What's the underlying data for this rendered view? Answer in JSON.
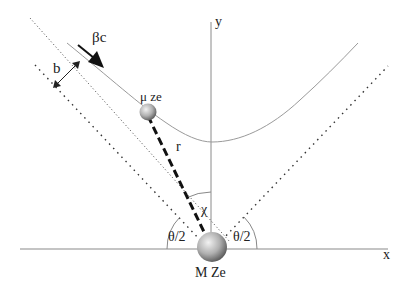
{
  "diagram": {
    "labels": {
      "velocity": "βc",
      "impact_parameter": "b",
      "projectile": "μ ze",
      "distance": "r",
      "angle_chi": "χ",
      "half_angle_left": "θ/2",
      "half_angle_right": "θ/2",
      "target": "M Ze",
      "x_axis": "x",
      "y_axis": "y"
    },
    "colors": {
      "line": "#222222",
      "curve": "#9a9a9a",
      "axis": "#8a8a8a",
      "sphere_light": "#e8e8e8",
      "sphere_dark": "#6a6a6a"
    }
  }
}
